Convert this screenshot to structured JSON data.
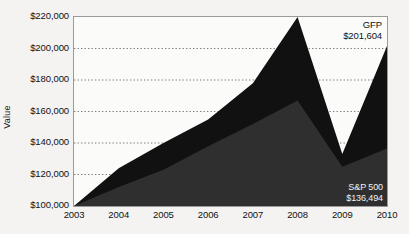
{
  "chart_data": {
    "type": "area",
    "title": "",
    "xlabel": "",
    "ylabel": "Value",
    "x": [
      2003,
      2004,
      2005,
      2006,
      2007,
      2008,
      2009,
      2010
    ],
    "xtick_labels": [
      "2003",
      "2004",
      "2005",
      "2006",
      "2007",
      "2008",
      "2009",
      "2010"
    ],
    "ytick_labels": [
      "$220,000",
      "$200,000",
      "$180,000",
      "$160,000",
      "$140,000",
      "$120,000",
      "$100,000"
    ],
    "ytick_values": [
      220000,
      200000,
      180000,
      160000,
      140000,
      120000,
      100000
    ],
    "ylim": [
      100000,
      220000
    ],
    "xlim": [
      2003,
      2010
    ],
    "grid": "horizontal-dotted",
    "legend": "inline-annotations",
    "series": [
      {
        "name": "GFP",
        "color": "#111111",
        "end_label": "$201,604",
        "end_value": 201604,
        "values": [
          100000,
          124000,
          140000,
          155000,
          178000,
          220000,
          133000,
          201604
        ]
      },
      {
        "name": "S&P 500",
        "color": "#2f2f2f",
        "end_label": "$136,494",
        "end_value": 136494,
        "values": [
          100000,
          112000,
          123000,
          138000,
          152000,
          167000,
          125000,
          136494
        ]
      }
    ]
  },
  "annotations": {
    "gfp": {
      "name": "GFP",
      "value": "$201,604"
    },
    "sp500": {
      "name": "S&P 500",
      "value": "$136,494"
    }
  }
}
